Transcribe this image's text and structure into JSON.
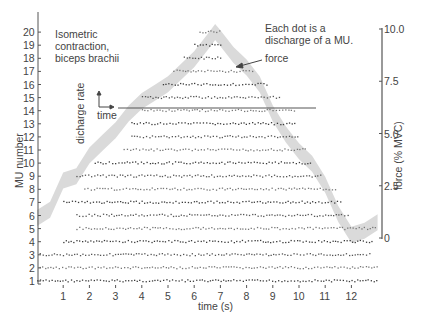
{
  "chart_data": {
    "type": "scatter",
    "title": "",
    "xlabel": "time (s)",
    "ylabel": "MU number",
    "y2label": "force (% MVC)",
    "xlim": [
      0,
      13
    ],
    "ylim": [
      1,
      20
    ],
    "y2lim": [
      0,
      10.0
    ],
    "x_ticks": [
      1,
      2,
      3,
      4,
      5,
      6,
      7,
      8,
      9,
      10,
      11,
      12
    ],
    "y_ticks": [
      1,
      2,
      3,
      4,
      5,
      6,
      7,
      8,
      9,
      10,
      11,
      12,
      13,
      14,
      15,
      16,
      17,
      18,
      19,
      20
    ],
    "y2_ticks": [
      "0",
      "2.5",
      "5.0",
      "7.5",
      "10.0"
    ],
    "grid": false,
    "annotations": [
      "Isometric contraction, biceps brachii",
      "Each dot is a discharge of a MU.",
      "force"
    ],
    "inset": {
      "ylabel": "dicharge rate",
      "xlabel": "time"
    },
    "series": [
      {
        "name": "force",
        "type": "area-band",
        "unit": "% MVC",
        "x": [
          0.0,
          0.5,
          1.0,
          1.5,
          2.0,
          2.5,
          3.0,
          3.5,
          4.0,
          4.5,
          5.0,
          5.5,
          6.0,
          6.5,
          6.8,
          7.0,
          7.5,
          8.0,
          8.5,
          9.0,
          9.5,
          10.0,
          10.5,
          11.0,
          11.5,
          12.0,
          12.5,
          13.0
        ],
        "y": [
          1.0,
          1.4,
          2.8,
          3.0,
          4.0,
          4.6,
          5.2,
          6.0,
          6.6,
          7.0,
          7.4,
          8.0,
          8.6,
          9.4,
          9.9,
          9.6,
          8.8,
          8.2,
          7.4,
          6.0,
          5.0,
          4.2,
          3.6,
          2.6,
          1.2,
          0.2,
          0.4,
          0.8
        ]
      },
      {
        "name": "MU discharges",
        "type": "scatter",
        "units": [
          {
            "mu": 1,
            "start": 0.0,
            "end": 13.0
          },
          {
            "mu": 2,
            "start": 0.1,
            "end": 13.0
          },
          {
            "mu": 3,
            "start": 0.1,
            "end": 12.8
          },
          {
            "mu": 4,
            "start": 1.0,
            "end": 12.8
          },
          {
            "mu": 5,
            "start": 1.5,
            "end": 12.9
          },
          {
            "mu": 6,
            "start": 1.5,
            "end": 11.9
          },
          {
            "mu": 7,
            "start": 1.0,
            "end": 11.6
          },
          {
            "mu": 8,
            "start": 1.8,
            "end": 11.4
          },
          {
            "mu": 9,
            "start": 1.5,
            "end": 10.9
          },
          {
            "mu": 10,
            "start": 2.2,
            "end": 10.5
          },
          {
            "mu": 11,
            "start": 3.3,
            "end": 10.3
          },
          {
            "mu": 12,
            "start": 3.6,
            "end": 10.0
          },
          {
            "mu": 13,
            "start": 3.6,
            "end": 9.9
          },
          {
            "mu": 14,
            "start": 4.0,
            "end": 9.9
          },
          {
            "mu": 15,
            "start": 4.0,
            "end": 9.3
          },
          {
            "mu": 16,
            "start": 4.8,
            "end": 8.8
          },
          {
            "mu": 17,
            "start": 5.2,
            "end": 8.3
          },
          {
            "mu": 18,
            "start": 5.6,
            "end": 7.0
          },
          {
            "mu": 19,
            "start": 6.0,
            "end": 7.0
          },
          {
            "mu": 20,
            "start": 6.2,
            "end": 7.0
          }
        ]
      }
    ],
    "legend": "none"
  },
  "labels": {
    "title_line1": "Isometric",
    "title_line2": "contraction,",
    "title_line3": "biceps brachii",
    "note_line1": "Each dot is a",
    "note_line2": "discharge of a MU.",
    "force_arrow": "force",
    "inset_y": "dicharge rate",
    "inset_x": "time",
    "xlabel": "time (s)",
    "ylabel": "MU number",
    "y2label": "force (% MVC)"
  }
}
